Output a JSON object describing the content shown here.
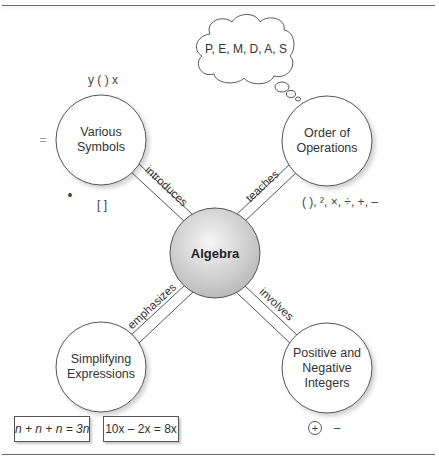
{
  "diagram": {
    "type": "concept-map",
    "center_node": {
      "label": "Algebra"
    },
    "nodes": [
      {
        "id": "various-symbols",
        "label_line1": "Various",
        "label_line2": "Symbols",
        "link_label": "introduces"
      },
      {
        "id": "order-of-operations",
        "label_line1": "Order of",
        "label_line2": "Operations",
        "link_label": "teaches"
      },
      {
        "id": "simplifying-expressions",
        "label_line1": "Simplifying",
        "label_line2": "Expressions",
        "link_label": "emphasizes"
      },
      {
        "id": "positive-negative-integers",
        "label_line1": "Positive and",
        "label_line2": "Negative",
        "label_line3": "Integers",
        "link_label": "involves"
      }
    ],
    "thought_cloud": {
      "text": "P, E, M, D, A, S"
    },
    "symbols": {
      "top": "y  (  )  x",
      "left": "=",
      "bullet": "•",
      "brackets": "[     ]",
      "operations": "( ), ², ×, ÷, +, –",
      "circled_plus": "+",
      "minus": "–"
    },
    "equations": [
      {
        "text": "n + n + n = 3n"
      },
      {
        "text": "10x – 2x = 8x"
      }
    ],
    "colors": {
      "outline": "#555555",
      "center_fill_light": "#f4f4f4",
      "center_fill_dark": "#bdbdbd",
      "rule": "#6a6a6a"
    }
  }
}
